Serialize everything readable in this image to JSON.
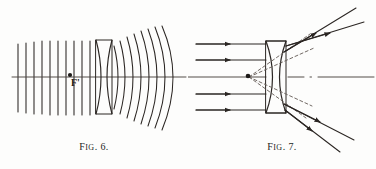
{
  "plate": {
    "background_color": "#fdfdfc",
    "ink_color": "#241f1d",
    "width": 376,
    "height": 169
  },
  "figures": [
    {
      "id": "figure-6",
      "caption_prefix": "F",
      "caption_smallcaps": "IG",
      "caption_suffix": ". 6.",
      "caption_text": "FIG. 6.",
      "subject": "plane wavefronts diverging after a biconcave lens",
      "focal_point_label": "F'",
      "plane_wavefront_count": 10,
      "curved_wavefront_count": 8,
      "lens_type": "biconcave",
      "axis": {
        "y": 77,
        "x_start": 12,
        "x_end": 186
      }
    },
    {
      "id": "figure-7",
      "caption_prefix": "F",
      "caption_smallcaps": "IG",
      "caption_suffix": ". 7.",
      "caption_text": "FIG. 7.",
      "subject": "parallel rays diverging after a biconcave lens with virtual focus",
      "focal_point_label": "F'",
      "incident_ray_count": 5,
      "refracted_ray_count": 4,
      "virtual_ray_count": 4,
      "virtual_ray_style": "dashed",
      "lens_type": "biconcave",
      "axis": {
        "y": 77,
        "x_start": 0,
        "x_end": 186
      }
    }
  ]
}
